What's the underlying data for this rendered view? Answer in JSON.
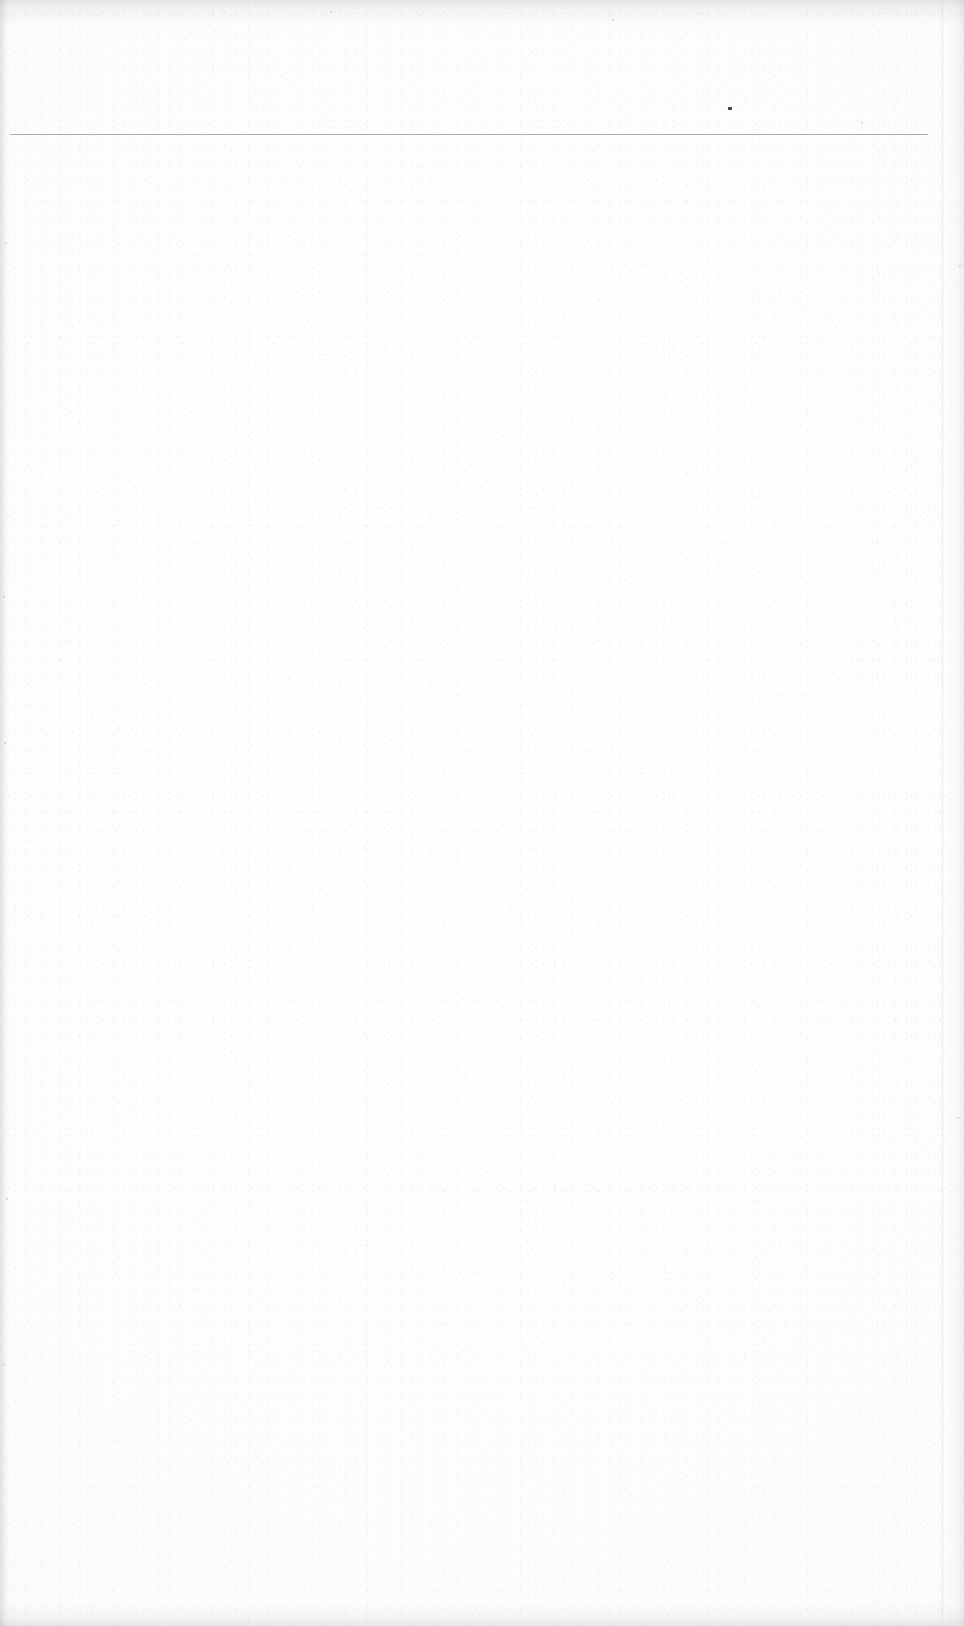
{
  "document": {
    "kind": "scanned-page",
    "title": "",
    "body_text": "",
    "is_blank": true,
    "notes": ""
  },
  "page": {
    "width_px": 964,
    "height_px": 1626,
    "background_color": "#fdfdfd",
    "paper_tone": "#fbfbfb"
  },
  "marks": {
    "header_rule": {
      "label": "",
      "x_start_px": 10,
      "x_end_px": 928,
      "y_px": 134,
      "thickness_px": 1,
      "color": "#787a82"
    },
    "ink_speck": {
      "label": "",
      "x_px": 728,
      "y_px": 107,
      "width_px": 4,
      "height_px": 3,
      "color": "#3a3a42"
    },
    "crease": {
      "label": "",
      "x_px": 941,
      "color": "#96969e"
    },
    "micro_specks": [
      {
        "x_px": 5,
        "y_px": 242
      },
      {
        "x_px": 3,
        "y_px": 596
      },
      {
        "x_px": 4,
        "y_px": 742
      },
      {
        "x_px": 6,
        "y_px": 1198
      },
      {
        "x_px": 2,
        "y_px": 1364
      },
      {
        "x_px": 861,
        "y_px": 122
      },
      {
        "x_px": 959,
        "y_px": 265
      },
      {
        "x_px": 957,
        "y_px": 1117
      },
      {
        "x_px": 612,
        "y_px": 19
      },
      {
        "x_px": 330,
        "y_px": 11
      }
    ]
  },
  "edges": {
    "top_shadow_color": "#9696a0",
    "bottom_shadow_color": "#9696a0",
    "left_shadow_color": "#92929c",
    "right_shadow_color": "#9696a0"
  }
}
